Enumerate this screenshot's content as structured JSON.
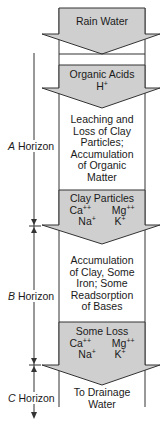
{
  "colors": {
    "arrow_fill": "#cfcfcf",
    "stroke": "#333333",
    "background": "#ffffff"
  },
  "arrows": [
    {
      "label": "Rain Water"
    },
    {
      "label": "Organic Acids",
      "ions": [
        {
          "base": "H",
          "charge": "+"
        }
      ]
    },
    {
      "label": "Clay Particles",
      "ions": [
        {
          "base": "Ca",
          "charge": "++"
        },
        {
          "base": "Mg",
          "charge": "++"
        },
        {
          "base": "Na",
          "charge": "+"
        },
        {
          "base": "K",
          "charge": "+"
        }
      ]
    },
    {
      "label": "Some Loss",
      "ions": [
        {
          "base": "Ca",
          "charge": "++"
        },
        {
          "base": "Mg",
          "charge": "++"
        },
        {
          "base": "Na",
          "charge": "+"
        },
        {
          "base": "K",
          "charge": "+"
        }
      ]
    }
  ],
  "zones": [
    {
      "text_lines": [
        "Leaching and",
        "Loss of Clay",
        "Particles;",
        "Accumulation",
        "of Organic",
        "Matter"
      ]
    },
    {
      "text_lines": [
        "Accumulation",
        "of Clay, Some",
        "Iron; Some",
        "Readsorption",
        "of Bases"
      ]
    },
    {
      "text_lines": [
        "To Drainage",
        "Water"
      ]
    }
  ],
  "horizons": [
    {
      "letter": "A",
      "word": "Horizon"
    },
    {
      "letter": "B",
      "word": "Horizon"
    },
    {
      "letter": "C",
      "word": "Horizon"
    }
  ]
}
